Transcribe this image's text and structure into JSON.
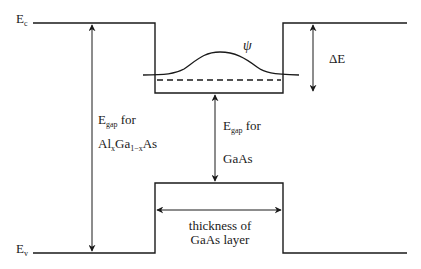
{
  "diagram": {
    "line_color": "#1a1a1a",
    "background": "#ffffff",
    "labels": {
      "ec": {
        "main": "E",
        "sub": "c"
      },
      "ev": {
        "main": "E",
        "sub": "v"
      },
      "psi": "ψ",
      "delta_e": "ΔE",
      "egap_algaas": {
        "line1_main": "E",
        "line1_sub": "gap",
        "line1_rest": " for",
        "line2_a": "Al",
        "line2_sub1": "x",
        "line2_b": "Ga",
        "line2_sub2": "1−x",
        "line2_c": "As"
      },
      "egap_gaas": {
        "line1_main": "E",
        "line1_sub": "gap",
        "line1_rest": " for",
        "line2": "GaAs"
      },
      "thickness": {
        "line1": "thickness of",
        "line2": "GaAs layer"
      }
    },
    "geometry": {
      "ec_y": 23,
      "well_bottom_y": 93,
      "ev_y": 253,
      "vb_top_y": 183,
      "left_x": 33,
      "well_left_x": 155,
      "well_right_x": 283,
      "right_x": 407,
      "wave_baseline_y": 75,
      "dashed_level_y": 80,
      "wave_peak_y": 52
    }
  }
}
